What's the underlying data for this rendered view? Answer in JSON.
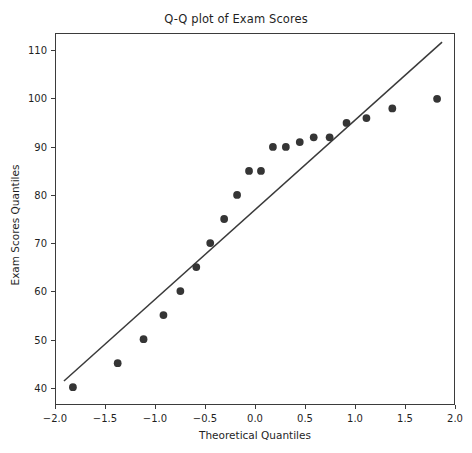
{
  "chart_data": {
    "type": "scatter",
    "title": "Q-Q plot of Exam Scores",
    "xlabel": "Theoretical Quantiles",
    "ylabel": "Exam Scores Quantiles",
    "xlim": [
      -2.0,
      2.0
    ],
    "ylim": [
      36.5,
      113.5
    ],
    "grid": false,
    "legend": null,
    "xticks": [
      -2.0,
      -1.5,
      -1.0,
      -0.5,
      0.0,
      0.5,
      1.0,
      1.5,
      2.0
    ],
    "xtick_labels": [
      "−2.0",
      "−1.5",
      "−1.0",
      "−0.5",
      "0.0",
      "0.5",
      "1.0",
      "1.5",
      "2.0"
    ],
    "yticks": [
      40,
      50,
      60,
      70,
      80,
      90,
      100,
      110
    ],
    "ytick_labels": [
      "40",
      "50",
      "60",
      "70",
      "80",
      "90",
      "100",
      "110"
    ],
    "marker_color": "#353535",
    "line_color": "#3a3a3a",
    "frame_color": "#3b3b3b",
    "background": "#ffffff",
    "series": [
      {
        "name": "Sample quantiles",
        "type": "scatter",
        "marker": "circle",
        "x": [
          -1.83,
          -1.38,
          -1.12,
          -0.92,
          -0.75,
          -0.59,
          -0.45,
          -0.31,
          -0.18,
          -0.06,
          0.06,
          0.18,
          0.31,
          0.45,
          0.59,
          0.75,
          0.92,
          1.12,
          1.38,
          1.83
        ],
        "y": [
          40,
          45,
          50,
          55,
          60,
          65,
          70,
          75,
          80,
          85,
          85,
          90,
          90,
          91,
          92,
          92,
          95,
          96,
          98,
          100
        ]
      },
      {
        "name": "Reference line",
        "type": "line",
        "x": [
          -1.92,
          1.88
        ],
        "y": [
          41.3,
          111.8
        ]
      }
    ]
  }
}
